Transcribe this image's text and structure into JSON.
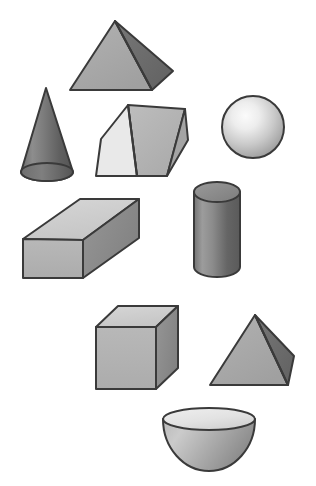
{
  "figure": {
    "background_color": "#ffffff",
    "width": 316,
    "height": 486,
    "outline_color": "#3a3a3a",
    "outline_width": 2
  },
  "palette": {
    "face_light": "#d8d8d8",
    "face_very_light": "#e8e8e8",
    "face_mid": "#a8a8a8",
    "face_mid_dark": "#8f8f8f",
    "face_dark": "#6e6e6e",
    "face_darkest": "#5a5a5a",
    "highlight": "#f2f2f2"
  },
  "shapes": [
    {
      "id": "pyramid-top",
      "name": "Square Pyramid",
      "label": "pyramid",
      "position": {
        "x": 68,
        "y": 18,
        "width": 88,
        "height": 76
      },
      "faces": [
        {
          "name": "front-face",
          "fill": "#a9a9a9",
          "points": "115,21 70,90 152,90"
        },
        {
          "name": "right-face",
          "fill": "#6f6f6f",
          "points": "115,21 152,90 173,71"
        }
      ]
    },
    {
      "id": "cone",
      "name": "Cone",
      "label": "cone",
      "position": {
        "x": 20,
        "y": 87,
        "width": 54,
        "height": 96
      },
      "apex": {
        "x": 46,
        "y": 88
      },
      "base_center": {
        "x": 47,
        "y": 172
      },
      "base_rx": 26,
      "base_ry": 9,
      "fill_light": "#8a8a8a",
      "fill_dark": "#5c5c5c"
    },
    {
      "id": "triangular-prism",
      "name": "Triangular Prism",
      "label": "triangular prism",
      "position": {
        "x": 90,
        "y": 100,
        "width": 98,
        "height": 78
      },
      "faces": [
        {
          "name": "triangle-end-face",
          "fill": "#e9e9e9",
          "points": "101,139 128,105 137,176 96,176"
        },
        {
          "name": "top-slope-face",
          "fill": "#b4b4b4",
          "points": "128,105 185,109 167,176 137,176"
        },
        {
          "name": "right-face",
          "fill": "#a0a0a0",
          "points": "185,109 188,140 167,176"
        }
      ]
    },
    {
      "id": "sphere",
      "name": "Sphere",
      "label": "sphere",
      "position": {
        "x": 222,
        "y": 96,
        "width": 62,
        "height": 62
      },
      "center": {
        "x": 253,
        "y": 127
      },
      "radius": 31,
      "highlight_center": {
        "x": 243,
        "y": 115
      },
      "fill_light": "#f6f6f6",
      "fill_dark": "#9a9a9a"
    },
    {
      "id": "cylinder",
      "name": "Cylinder",
      "label": "cylinder",
      "position": {
        "x": 194,
        "y": 182,
        "width": 47,
        "height": 95
      },
      "top_center": {
        "x": 217,
        "y": 192
      },
      "top_rx": 23,
      "top_ry": 10,
      "bottom_center": {
        "x": 217,
        "y": 267
      },
      "body_top_y": 192,
      "body_bottom_y": 267,
      "fill_top": "#8e8e8e",
      "fill_light": "#9c9c9c",
      "fill_dark": "#5e5e5e"
    },
    {
      "id": "cuboid",
      "name": "Rectangular Prism (Cuboid)",
      "label": "cuboid",
      "position": {
        "x": 22,
        "y": 197,
        "width": 117,
        "height": 82
      },
      "faces": [
        {
          "name": "top-face",
          "fill": "#cfcfcf",
          "points": "23,239 80,199 139,199 83,240"
        },
        {
          "name": "front-face",
          "fill": "#b2b2b2",
          "points": "23,239 83,240 83,278 23,278"
        },
        {
          "name": "right-face",
          "fill": "#8c8c8c",
          "points": "83,240 139,199 139,238 83,278"
        }
      ]
    },
    {
      "id": "cube",
      "name": "Cube",
      "label": "cube",
      "position": {
        "x": 95,
        "y": 305,
        "width": 83,
        "height": 85
      },
      "faces": [
        {
          "name": "top-face",
          "fill": "#cfcfcf",
          "points": "96,327 118,306 178,306 156,327"
        },
        {
          "name": "front-face",
          "fill": "#b2b2b2",
          "points": "96,327 156,327 156,389 96,389"
        },
        {
          "name": "right-face",
          "fill": "#8c8c8c",
          "points": "156,327 178,306 178,368 156,389"
        }
      ]
    },
    {
      "id": "pyramid-bottom",
      "name": "Square Pyramid",
      "label": "pyramid",
      "position": {
        "x": 208,
        "y": 313,
        "width": 86,
        "height": 76
      },
      "faces": [
        {
          "name": "front-face",
          "fill": "#a9a9a9",
          "points": "255,315 210,385 288,385"
        },
        {
          "name": "right-face",
          "fill": "#6f6f6f",
          "points": "255,315 288,385 294,356"
        }
      ]
    },
    {
      "id": "hemisphere",
      "name": "Hemisphere",
      "label": "hemisphere",
      "position": {
        "x": 163,
        "y": 411,
        "width": 93,
        "height": 62
      },
      "center": {
        "x": 209,
        "y": 419
      },
      "rx": 46,
      "ry": 11,
      "depth": 52,
      "fill_top": "#e3e3e3",
      "fill_light": "#b6b6b6",
      "fill_dark": "#8c8c8c"
    }
  ]
}
